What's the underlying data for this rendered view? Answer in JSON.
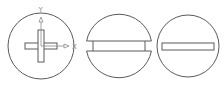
{
  "figure": {
    "colors": {
      "line": "#5a5a5a",
      "axis": "#8a8a8a",
      "background": "#ffffff"
    },
    "panels": [
      {
        "id": "cross-head",
        "label": "",
        "axes": {
          "x_label": "X",
          "y_label": "Y"
        }
      },
      {
        "id": "split-slot-head",
        "label": ""
      },
      {
        "id": "slot-head",
        "label": ""
      }
    ]
  }
}
